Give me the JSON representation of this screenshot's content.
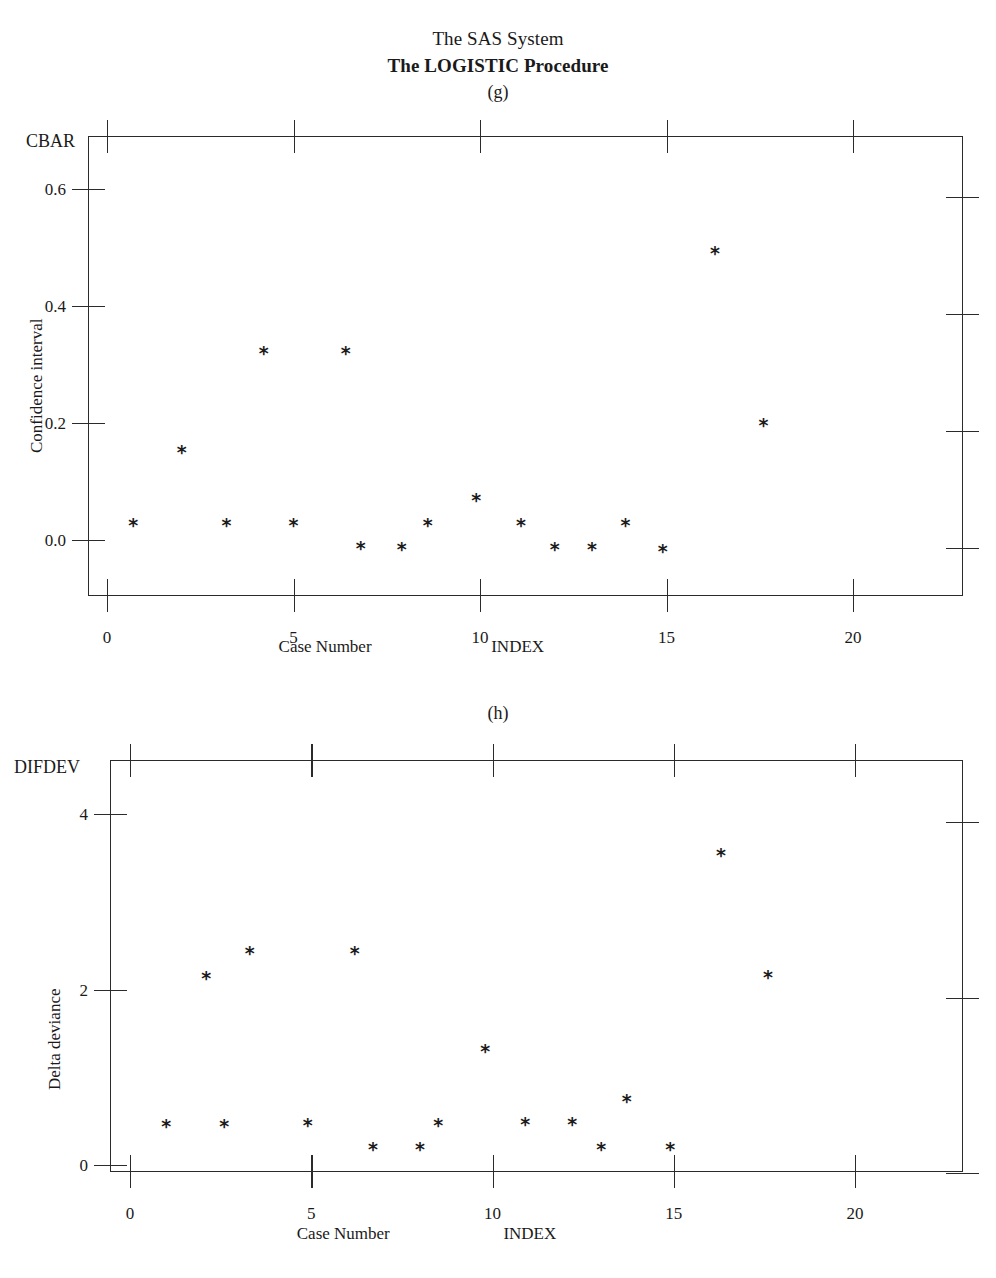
{
  "header": {
    "title": "The SAS System",
    "subtitle": "The LOGISTIC Procedure"
  },
  "panels": [
    {
      "tag": "(g)",
      "y_axis_name": "CBAR",
      "y_axis_title": "Confidence interval",
      "x_axis_title": "Case Number",
      "x_axis_variable": "INDEX",
      "y_ticks": [
        "0.0",
        "0.2",
        "0.4",
        "0.6"
      ],
      "x_ticks": [
        "0",
        "5",
        "10",
        "15",
        "20"
      ]
    },
    {
      "tag": "(h)",
      "y_axis_name": "DIFDEV",
      "y_axis_title": "Delta deviance",
      "x_axis_title": "Case Number",
      "x_axis_variable": "INDEX",
      "y_ticks": [
        "0",
        "2",
        "4"
      ],
      "x_ticks": [
        "0",
        "5",
        "10",
        "15",
        "20"
      ]
    }
  ],
  "chart_data": [
    {
      "type": "scatter",
      "title": "The SAS System / The LOGISTIC Procedure",
      "panel": "(g)",
      "xlabel": "Case Number",
      "x_variable": "INDEX",
      "ylabel": "Confidence interval",
      "y_variable": "CBAR",
      "xlim": [
        -0.6,
        23.0
      ],
      "ylim": [
        -0.08,
        0.69
      ],
      "xticks": [
        0,
        5,
        10,
        15,
        20
      ],
      "yticks": [
        0.0,
        0.2,
        0.4,
        0.6
      ],
      "grid": false,
      "legend": "none",
      "marker": "*",
      "marker_color": "#1c1c1c",
      "points": [
        {
          "x": 0.7,
          "y": 0.025
        },
        {
          "x": 2.0,
          "y": 0.15
        },
        {
          "x": 3.2,
          "y": 0.025
        },
        {
          "x": 4.2,
          "y": 0.32
        },
        {
          "x": 5.0,
          "y": 0.025
        },
        {
          "x": 6.4,
          "y": 0.32
        },
        {
          "x": 6.8,
          "y": -0.014
        },
        {
          "x": 7.9,
          "y": -0.016
        },
        {
          "x": 8.6,
          "y": 0.025
        },
        {
          "x": 9.9,
          "y": 0.068
        },
        {
          "x": 11.1,
          "y": 0.025
        },
        {
          "x": 12.0,
          "y": -0.016
        },
        {
          "x": 13.0,
          "y": -0.016
        },
        {
          "x": 13.9,
          "y": 0.025
        },
        {
          "x": 14.9,
          "y": -0.018
        },
        {
          "x": 16.3,
          "y": 0.49
        },
        {
          "x": 17.6,
          "y": 0.196
        }
      ]
    },
    {
      "type": "scatter",
      "title": "The SAS System / The LOGISTIC Procedure",
      "panel": "(h)",
      "xlabel": "Case Number",
      "x_variable": "INDEX",
      "ylabel": "Delta deviance",
      "y_variable": "DIFDEV",
      "xlim": [
        -0.6,
        23.0
      ],
      "ylim": [
        -0.55,
        4.55
      ],
      "xticks": [
        0,
        5,
        10,
        15,
        20
      ],
      "yticks": [
        0,
        2,
        4
      ],
      "grid": false,
      "legend": "none",
      "marker": "*",
      "marker_color": "#1c1c1c",
      "points": [
        {
          "x": 1.0,
          "y": 0.45
        },
        {
          "x": 2.1,
          "y": 2.13
        },
        {
          "x": 2.6,
          "y": 0.45
        },
        {
          "x": 3.3,
          "y": 2.42
        },
        {
          "x": 4.9,
          "y": 0.46
        },
        {
          "x": 6.2,
          "y": 2.42
        },
        {
          "x": 6.7,
          "y": 0.18
        },
        {
          "x": 8.0,
          "y": 0.18
        },
        {
          "x": 8.5,
          "y": 0.46
        },
        {
          "x": 9.8,
          "y": 1.3
        },
        {
          "x": 10.9,
          "y": 0.47
        },
        {
          "x": 12.2,
          "y": 0.47
        },
        {
          "x": 13.0,
          "y": 0.18
        },
        {
          "x": 13.7,
          "y": 0.73
        },
        {
          "x": 14.9,
          "y": 0.18
        },
        {
          "x": 16.3,
          "y": 3.53
        },
        {
          "x": 17.6,
          "y": 2.14
        }
      ]
    }
  ]
}
